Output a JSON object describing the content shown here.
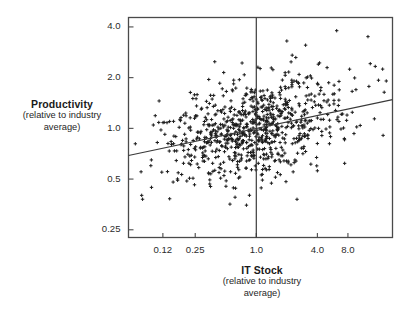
{
  "figure": {
    "background_color": "#ffffff",
    "frame_color": "#4a4a4a",
    "marker_color": "#1c1c1c",
    "line_color": "#3a3a3a"
  },
  "yaxis": {
    "title_main": "Productivity",
    "title_sub_line1": "(relative to industry",
    "title_sub_line2": "average)",
    "scale": "log",
    "ticks": [
      {
        "label": "4.0",
        "value": 4.0
      },
      {
        "label": "2.0",
        "value": 2.0
      },
      {
        "label": "1.0",
        "value": 1.0
      },
      {
        "label": "0.5",
        "value": 0.5
      },
      {
        "label": "0.25",
        "value": 0.25
      }
    ]
  },
  "xaxis": {
    "title_main": "IT Stock",
    "title_sub_line1": "(relative to industry",
    "title_sub_line2": "average)",
    "scale": "log",
    "ticks": [
      {
        "label": "0.12",
        "value": 0.12
      },
      {
        "label": "0.25",
        "value": 0.25
      },
      {
        "label": "1.0",
        "value": 1.0
      },
      {
        "label": "4.0",
        "value": 4.0
      },
      {
        "label": "8.0",
        "value": 8.0
      }
    ]
  },
  "chart_data": {
    "type": "scatter",
    "title": "",
    "xlabel": "IT Stock (relative to industry average)",
    "ylabel": "Productivity (relative to industry average)",
    "x_scale": "log",
    "y_scale": "log",
    "xlim": [
      0.055,
      22.0
    ],
    "ylim": [
      0.225,
      4.55
    ],
    "grid": false,
    "legend": "none",
    "n_points": 840,
    "marker": "plus-cross",
    "marker_size_px": 3.4,
    "reference_line": {
      "type": "vertical",
      "x": 1.0,
      "label": "industry average IT stock"
    },
    "fit_line": {
      "type": "linear-in-logs",
      "x_start": 0.055,
      "y_start": 0.69,
      "x_end": 22.0,
      "y_end": 1.48,
      "slope_log": 0.128
    },
    "cluster": {
      "x_center_log10": -0.02,
      "x_sd_log10": 0.46,
      "y_center_log10": 0.0,
      "y_sd_log10": 0.155,
      "correlation": 0.34
    },
    "notable_points": [
      {
        "x": 2.0,
        "y": 3.3,
        "note": "high outlier"
      },
      {
        "x": 6.2,
        "y": 3.8,
        "note": "high outlier"
      },
      {
        "x": 0.34,
        "y": 1.95,
        "note": "upper left outlier"
      },
      {
        "x": 16.0,
        "y": 1.93,
        "note": "upper right outlier"
      },
      {
        "x": 0.55,
        "y": 0.355,
        "note": "low outlier"
      },
      {
        "x": 0.8,
        "y": 0.35,
        "note": "low outlier"
      },
      {
        "x": 0.17,
        "y": 0.545,
        "note": "low outlier"
      },
      {
        "x": 4.0,
        "y": 0.56,
        "note": "low right outlier"
      }
    ]
  }
}
